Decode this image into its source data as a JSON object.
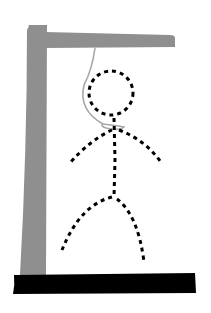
{
  "game": {
    "name": "hangman",
    "stage": "complete-figure",
    "figure_style": "dashed-outline"
  },
  "colors": {
    "background": "#ffffff",
    "gallows": "#8f8f8f",
    "base": "#000000",
    "figure": "#000000",
    "rope": "#a8a8a8"
  },
  "parts": [
    "gallows-post",
    "gallows-beam",
    "gallows-base",
    "rope",
    "head",
    "body",
    "left-arm",
    "right-arm",
    "left-leg",
    "right-leg"
  ]
}
